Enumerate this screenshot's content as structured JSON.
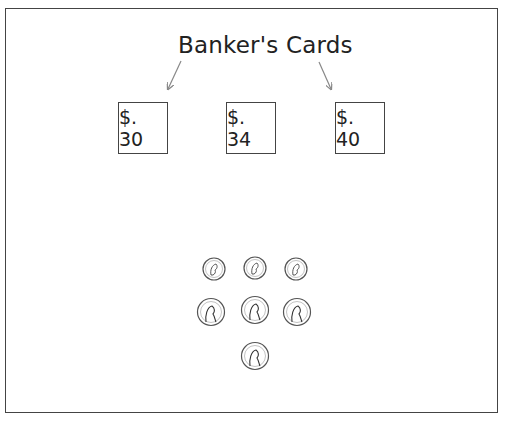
{
  "title": "Banker's Cards",
  "cards": [
    {
      "label": "$. 30",
      "x": 118
    },
    {
      "label": "$. 34",
      "x": 226
    },
    {
      "label": "$. 40",
      "x": 335
    }
  ],
  "coins": [
    {
      "type": "dime",
      "name": "dime-1"
    },
    {
      "type": "dime",
      "name": "dime-2"
    },
    {
      "type": "dime",
      "name": "dime-3"
    },
    {
      "type": "penny",
      "name": "penny-1"
    },
    {
      "type": "penny",
      "name": "penny-2"
    },
    {
      "type": "penny",
      "name": "penny-3"
    },
    {
      "type": "penny",
      "name": "penny-4"
    }
  ],
  "colors": {
    "line": "#444444",
    "arrow": "#888888",
    "coin": "#555555"
  }
}
